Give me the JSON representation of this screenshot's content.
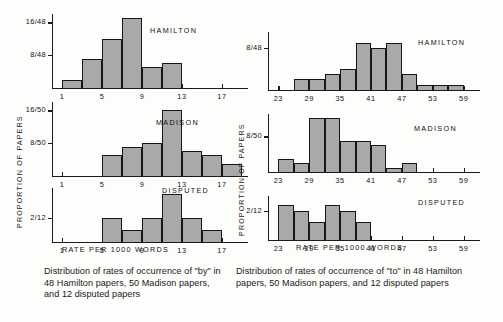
{
  "figure": {
    "yaxis_title": "PROPORTION OF PAPERS",
    "xaxis_title": "RATE PER 1000 WORDS"
  },
  "left": {
    "caption": "Distribution of rates of occurrence of \"by\" in 48 Hamilton papers, 50 Madison papers, and 12 disputed papers",
    "xaxis_title": "RATE PER 1000 WORDS",
    "yaxis_title": "PROPORTION OF PAPERS",
    "panels": [
      {
        "name": "HAMILTON",
        "yticks": [
          "16/48",
          "8/48"
        ],
        "xticks": [
          "1",
          "5",
          "9",
          "13",
          "17"
        ]
      },
      {
        "name": "MADISON",
        "yticks": [
          "16/50",
          "8/50"
        ],
        "xticks": [
          "1",
          "5",
          "9",
          "13",
          "17"
        ]
      },
      {
        "name": "DISPUTED",
        "yticks": [
          "2/12"
        ],
        "xticks": [
          "1",
          "5",
          "9",
          "13",
          "17"
        ]
      }
    ]
  },
  "right": {
    "caption": "Distribution of rates of occurrence of \"to\" in 48 Hamilton papers, 50 Madison papers, and 12 disputed papers",
    "xaxis_title": "RATE PER 1000 WORDS",
    "yaxis_title": "PROPORTION OF PAPERS",
    "panels": [
      {
        "name": "HAMILTON",
        "yticks": [
          "8/48"
        ],
        "xticks": [
          "23",
          "29",
          "35",
          "41",
          "47",
          "53",
          "59"
        ]
      },
      {
        "name": "MADISON",
        "yticks": [
          "8/50"
        ],
        "xticks": [
          "23",
          "29",
          "35",
          "41",
          "47",
          "53",
          "59"
        ]
      },
      {
        "name": "DISPUTED",
        "yticks": [
          "2/12"
        ],
        "xticks": [
          "23",
          "29",
          "35",
          "41",
          "47",
          "53",
          "59"
        ]
      }
    ]
  },
  "chart_data": [
    {
      "type": "bar",
      "id": "by-hamilton",
      "title": "HAMILTON",
      "word": "by",
      "n_papers": 48,
      "xlabel": "RATE PER 1000 WORDS",
      "ylabel": "PROPORTION OF PAPERS",
      "bin_width": 2,
      "xlim": [
        0,
        19
      ],
      "ylim": [
        0,
        18
      ],
      "ytick_values": [
        16,
        8
      ],
      "ytick_labels": [
        "16/48",
        "8/48"
      ],
      "xtick_values": [
        1,
        5,
        9,
        13,
        17
      ],
      "xtick_labels": [
        "1",
        "5",
        "9",
        "13",
        "17"
      ],
      "bin_starts": [
        1,
        3,
        5,
        7,
        9,
        11
      ],
      "values": [
        2,
        7,
        12,
        17,
        5,
        6
      ],
      "grid": false,
      "legend": "none"
    },
    {
      "type": "bar",
      "id": "by-madison",
      "title": "MADISON",
      "word": "by",
      "n_papers": 50,
      "xlabel": "RATE PER 1000 WORDS",
      "ylabel": "PROPORTION OF PAPERS",
      "bin_width": 2,
      "xlim": [
        0,
        19
      ],
      "ylim": [
        0,
        18
      ],
      "ytick_values": [
        16,
        8
      ],
      "ytick_labels": [
        "16/50",
        "8/50"
      ],
      "xtick_values": [
        1,
        5,
        9,
        13,
        17
      ],
      "xtick_labels": [
        "1",
        "5",
        "9",
        "13",
        "17"
      ],
      "bin_starts": [
        5,
        7,
        9,
        11,
        13,
        15,
        17
      ],
      "values": [
        5,
        7,
        8,
        16,
        6,
        5,
        3
      ],
      "grid": false,
      "legend": "none"
    },
    {
      "type": "bar",
      "id": "by-disputed",
      "title": "DISPUTED",
      "word": "by",
      "n_papers": 12,
      "xlabel": "RATE PER 1000 WORDS",
      "ylabel": "PROPORTION OF PAPERS",
      "bin_width": 2,
      "xlim": [
        0,
        19
      ],
      "ylim": [
        0,
        4.5
      ],
      "ytick_values": [
        2
      ],
      "ytick_labels": [
        "2/12"
      ],
      "xtick_values": [
        1,
        5,
        9,
        13,
        17
      ],
      "xtick_labels": [
        "1",
        "5",
        "9",
        "13",
        "17"
      ],
      "bin_starts": [
        5,
        7,
        9,
        11,
        13,
        15
      ],
      "values": [
        2,
        1,
        2,
        4,
        2,
        1
      ],
      "grid": false,
      "legend": "none"
    },
    {
      "type": "bar",
      "id": "to-hamilton",
      "title": "HAMILTON",
      "word": "to",
      "n_papers": 48,
      "xlabel": "RATE PER 1000 WORDS",
      "ylabel": "PROPORTION OF PAPERS",
      "bin_width": 3,
      "xlim": [
        21,
        61
      ],
      "ylim": [
        0,
        11
      ],
      "ytick_values": [
        8
      ],
      "ytick_labels": [
        "8/48"
      ],
      "xtick_values": [
        23,
        29,
        35,
        41,
        47,
        53,
        59
      ],
      "xtick_labels": [
        "23",
        "29",
        "35",
        "41",
        "47",
        "53",
        "59"
      ],
      "bin_starts": [
        26,
        29,
        32,
        35,
        38,
        41,
        44,
        47,
        50,
        53,
        56
      ],
      "values": [
        2,
        2,
        3,
        4,
        9,
        8,
        9,
        3,
        1,
        1,
        1
      ],
      "grid": false,
      "legend": "none"
    },
    {
      "type": "bar",
      "id": "to-madison",
      "title": "MADISON",
      "word": "to",
      "n_papers": 50,
      "xlabel": "RATE PER 1000 WORDS",
      "ylabel": "PROPORTION OF PAPERS",
      "bin_width": 3,
      "xlim": [
        21,
        61
      ],
      "ylim": [
        0,
        13
      ],
      "ytick_values": [
        8
      ],
      "ytick_labels": [
        "8/50"
      ],
      "xtick_values": [
        23,
        29,
        35,
        41,
        47,
        53,
        59
      ],
      "xtick_labels": [
        "23",
        "29",
        "35",
        "41",
        "47",
        "53",
        "59"
      ],
      "bin_starts": [
        23,
        26,
        29,
        32,
        35,
        38,
        41,
        44,
        47
      ],
      "values": [
        3,
        2,
        12,
        12,
        7,
        7,
        6,
        1,
        2
      ],
      "grid": false,
      "legend": "none"
    },
    {
      "type": "bar",
      "id": "to-disputed",
      "title": "DISPUTED",
      "word": "to",
      "n_papers": 12,
      "xlabel": "RATE PER 1000 WORDS",
      "ylabel": "PROPORTION OF PAPERS",
      "bin_width": 3,
      "xlim": [
        21,
        61
      ],
      "ylim": [
        0,
        3
      ],
      "ytick_values": [
        2
      ],
      "ytick_labels": [
        "2/12"
      ],
      "xtick_values": [
        23,
        29,
        35,
        41,
        47,
        53,
        59
      ],
      "xtick_labels": [
        "23",
        "29",
        "35",
        "41",
        "47",
        "53",
        "59"
      ],
      "bin_starts": [
        23,
        26,
        29,
        32,
        35,
        38
      ],
      "values": [
        2.4,
        2,
        1.2,
        2.4,
        2,
        1.2
      ],
      "grid": false,
      "legend": "none"
    }
  ]
}
